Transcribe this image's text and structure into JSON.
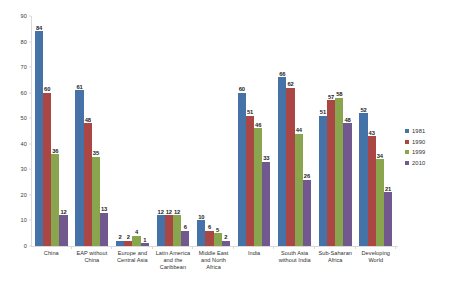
{
  "chart_data": {
    "type": "bar",
    "title": "",
    "subtitle": "",
    "xlabel": "",
    "ylabel": "",
    "ylim": [
      0,
      90
    ],
    "ytick_step": 10,
    "yticks": [
      0,
      10,
      20,
      30,
      40,
      50,
      60,
      70,
      80,
      90
    ],
    "grid": false,
    "legend_position": "right",
    "categories": [
      "China",
      "EAP without China",
      "Europe and Central Asia",
      "Latin America and the Caribbean",
      "Middle East and North Africa",
      "India",
      "South Asia without India",
      "Sub-Saharan Africa",
      "Developing World"
    ],
    "series": [
      {
        "name": "1981",
        "color": "#4572A7",
        "values": [
          84,
          61,
          2,
          12,
          10,
          60,
          66,
          51,
          52
        ]
      },
      {
        "name": "1990",
        "color": "#AA4643",
        "values": [
          60,
          48,
          2,
          12,
          6,
          51,
          62,
          57,
          43
        ]
      },
      {
        "name": "1999",
        "color": "#89A54E",
        "values": [
          36,
          35,
          4,
          12,
          5,
          46,
          44,
          58,
          34
        ]
      },
      {
        "name": "2010",
        "color": "#71588F",
        "values": [
          12,
          13,
          1,
          6,
          2,
          33,
          26,
          48,
          21
        ]
      }
    ]
  },
  "axis": {
    "y_tick_labels": [
      "0",
      "10",
      "20",
      "30",
      "40",
      "50",
      "60",
      "70",
      "80",
      "90"
    ]
  },
  "legend": {
    "items": [
      {
        "label": "1981",
        "color": "#4572A7"
      },
      {
        "label": "1990",
        "color": "#AA4643"
      },
      {
        "label": "1999",
        "color": "#89A54E"
      },
      {
        "label": "2010",
        "color": "#71588F"
      }
    ]
  }
}
